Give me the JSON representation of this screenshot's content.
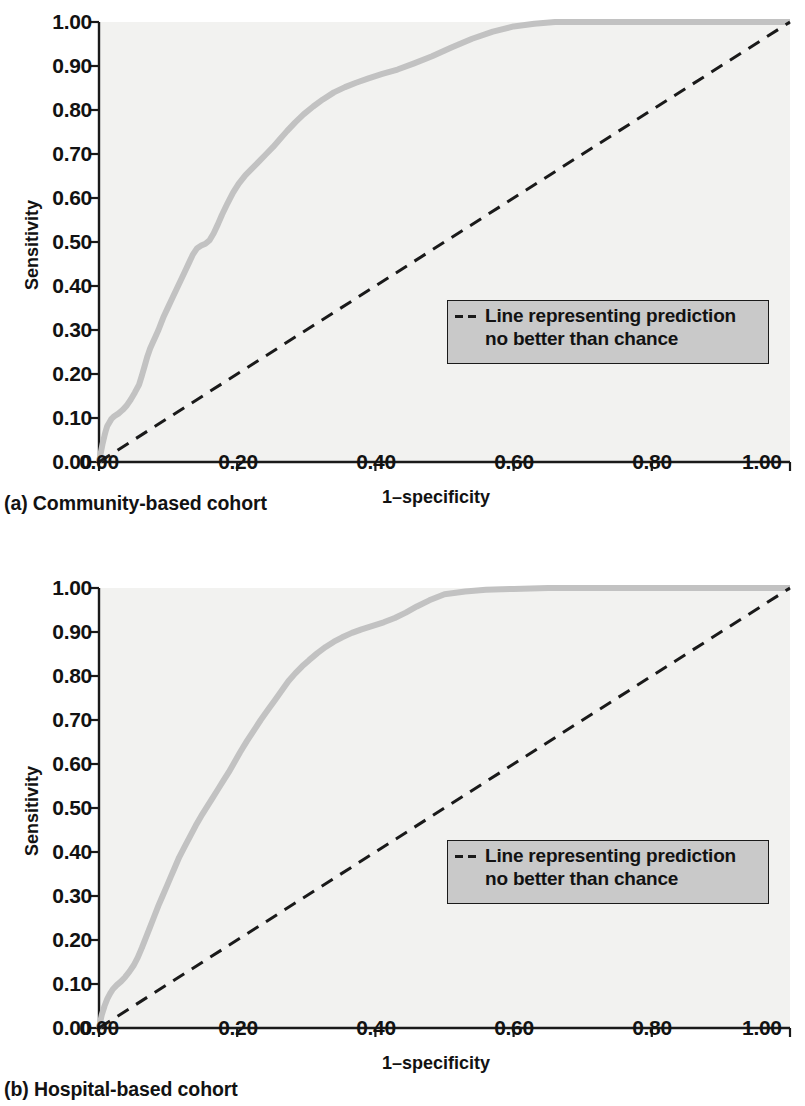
{
  "figure": {
    "panels": [
      {
        "id": "a",
        "caption": "(a) Community-based cohort",
        "xlabel": "1–specificity",
        "ylabel": "Sensitivity",
        "legend_text": "Line representing prediction\nno better than chance"
      },
      {
        "id": "b",
        "caption": "(b) Hospital-based cohort",
        "xlabel": "1–specificity",
        "ylabel": "Sensitivity",
        "legend_text": "Line representing prediction\nno better than chance"
      }
    ],
    "colors": {
      "roc_curve": "#c2c2c2",
      "chance_line": "#1a1a1a",
      "axis": "#1a1a1a",
      "plot_background": "#f2f2f0",
      "legend_background": "#c9c9c9"
    }
  },
  "chart_data": [
    {
      "type": "line",
      "title": "(a) Community-based cohort",
      "xlabel": "1–specificity",
      "ylabel": "Sensitivity",
      "xlim": [
        0,
        1
      ],
      "ylim": [
        0,
        1
      ],
      "xticks": [
        "0.00",
        "0.20",
        "0.40",
        "0.60",
        "0.80",
        "1.00"
      ],
      "xtick_values": [
        0.0,
        0.2,
        0.4,
        0.6,
        0.8,
        1.0
      ],
      "yticks": [
        "0.00",
        "0.10",
        "0.20",
        "0.30",
        "0.40",
        "0.50",
        "0.60",
        "0.70",
        "0.80",
        "0.90",
        "1.00"
      ],
      "ytick_values": [
        0.0,
        0.1,
        0.2,
        0.3,
        0.4,
        0.5,
        0.6,
        0.7,
        0.8,
        0.9,
        1.0
      ],
      "grid": false,
      "legend_position": "center-right",
      "series": [
        {
          "name": "ROC curve",
          "color": "#c2c2c2",
          "style": "solid",
          "x": [
            0.0,
            0.005,
            0.008,
            0.01,
            0.012,
            0.015,
            0.018,
            0.022,
            0.028,
            0.034,
            0.04,
            0.046,
            0.052,
            0.058,
            0.062,
            0.066,
            0.07,
            0.074,
            0.078,
            0.082,
            0.086,
            0.09,
            0.094,
            0.1,
            0.106,
            0.112,
            0.118,
            0.124,
            0.13,
            0.136,
            0.142,
            0.148,
            0.154,
            0.16,
            0.166,
            0.172,
            0.178,
            0.186,
            0.194,
            0.202,
            0.212,
            0.222,
            0.232,
            0.242,
            0.252,
            0.262,
            0.272,
            0.284,
            0.296,
            0.31,
            0.324,
            0.34,
            0.356,
            0.372,
            0.39,
            0.41,
            0.432,
            0.456,
            0.482,
            0.51,
            0.54,
            0.57,
            0.6,
            0.63,
            0.66,
            0.7,
            0.75,
            0.8,
            0.86,
            0.92,
            0.96,
            1.0
          ],
          "y": [
            0.0,
            0.04,
            0.06,
            0.072,
            0.082,
            0.09,
            0.098,
            0.104,
            0.11,
            0.118,
            0.128,
            0.142,
            0.158,
            0.176,
            0.196,
            0.218,
            0.24,
            0.258,
            0.272,
            0.286,
            0.3,
            0.316,
            0.332,
            0.352,
            0.372,
            0.392,
            0.412,
            0.432,
            0.452,
            0.472,
            0.486,
            0.492,
            0.496,
            0.504,
            0.52,
            0.54,
            0.562,
            0.588,
            0.612,
            0.632,
            0.652,
            0.668,
            0.684,
            0.7,
            0.716,
            0.734,
            0.752,
            0.772,
            0.79,
            0.808,
            0.824,
            0.84,
            0.852,
            0.862,
            0.872,
            0.882,
            0.892,
            0.906,
            0.922,
            0.942,
            0.962,
            0.978,
            0.99,
            0.996,
            1.0,
            1.0,
            1.0,
            1.0,
            1.0,
            1.0,
            1.0,
            1.0
          ]
        },
        {
          "name": "Line representing prediction no better than chance",
          "color": "#1a1a1a",
          "style": "dashed",
          "x": [
            0.0,
            1.0
          ],
          "y": [
            0.0,
            1.0
          ]
        }
      ]
    },
    {
      "type": "line",
      "title": "(b) Hospital-based cohort",
      "xlabel": "1–specificity",
      "ylabel": "Sensitivity",
      "xlim": [
        0,
        1
      ],
      "ylim": [
        0,
        1
      ],
      "xticks": [
        "0.00",
        "0.20",
        "0.40",
        "0.60",
        "0.80",
        "1.00"
      ],
      "xtick_values": [
        0.0,
        0.2,
        0.4,
        0.6,
        0.8,
        1.0
      ],
      "yticks": [
        "0.00",
        "0.10",
        "0.20",
        "0.30",
        "0.40",
        "0.50",
        "0.60",
        "0.70",
        "0.80",
        "0.90",
        "1.00"
      ],
      "ytick_values": [
        0.0,
        0.1,
        0.2,
        0.3,
        0.4,
        0.5,
        0.6,
        0.7,
        0.8,
        0.9,
        1.0
      ],
      "grid": false,
      "legend_position": "center-right",
      "series": [
        {
          "name": "ROC curve",
          "color": "#c2c2c2",
          "style": "solid",
          "x": [
            0.0,
            0.004,
            0.008,
            0.012,
            0.016,
            0.02,
            0.026,
            0.032,
            0.038,
            0.044,
            0.05,
            0.056,
            0.062,
            0.068,
            0.074,
            0.08,
            0.086,
            0.092,
            0.098,
            0.104,
            0.11,
            0.116,
            0.124,
            0.132,
            0.14,
            0.148,
            0.156,
            0.164,
            0.172,
            0.18,
            0.188,
            0.196,
            0.204,
            0.214,
            0.224,
            0.234,
            0.244,
            0.254,
            0.264,
            0.274,
            0.284,
            0.294,
            0.304,
            0.316,
            0.328,
            0.34,
            0.352,
            0.366,
            0.38,
            0.396,
            0.412,
            0.428,
            0.444,
            0.46,
            0.478,
            0.5,
            0.53,
            0.56,
            0.6,
            0.65,
            0.7,
            0.76,
            0.82,
            0.88,
            0.94,
            1.0
          ],
          "y": [
            0.0,
            0.03,
            0.05,
            0.066,
            0.078,
            0.088,
            0.098,
            0.106,
            0.116,
            0.128,
            0.142,
            0.16,
            0.182,
            0.206,
            0.23,
            0.254,
            0.278,
            0.3,
            0.322,
            0.344,
            0.366,
            0.388,
            0.412,
            0.436,
            0.46,
            0.482,
            0.502,
            0.522,
            0.542,
            0.562,
            0.582,
            0.604,
            0.626,
            0.652,
            0.676,
            0.7,
            0.722,
            0.744,
            0.766,
            0.788,
            0.806,
            0.822,
            0.836,
            0.852,
            0.866,
            0.878,
            0.888,
            0.898,
            0.906,
            0.914,
            0.922,
            0.932,
            0.944,
            0.958,
            0.972,
            0.986,
            0.992,
            0.996,
            0.998,
            1.0,
            1.0,
            1.0,
            1.0,
            1.0,
            1.0,
            1.0
          ]
        },
        {
          "name": "Line representing prediction no better than chance",
          "color": "#1a1a1a",
          "style": "dashed",
          "x": [
            0.0,
            1.0
          ],
          "y": [
            0.0,
            1.0
          ]
        }
      ]
    }
  ]
}
